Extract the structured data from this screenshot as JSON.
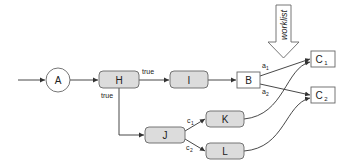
{
  "diagram": {
    "nodes": {
      "A": {
        "label": "A",
        "shape": "circle"
      },
      "H": {
        "label": "H",
        "shape": "rounded-box"
      },
      "I": {
        "label": "I",
        "shape": "rounded-box"
      },
      "B": {
        "label": "B",
        "shape": "box"
      },
      "C1": {
        "label": "C",
        "sub": "1",
        "shape": "box"
      },
      "C2": {
        "label": "C",
        "sub": "2",
        "shape": "box"
      },
      "J": {
        "label": "J",
        "shape": "rounded-box"
      },
      "K": {
        "label": "K",
        "shape": "rounded-box"
      },
      "L": {
        "label": "L",
        "shape": "rounded-box"
      }
    },
    "edges": [
      {
        "from": "start",
        "to": "A",
        "label": ""
      },
      {
        "from": "A",
        "to": "H",
        "label": ""
      },
      {
        "from": "H",
        "to": "I",
        "label": "true"
      },
      {
        "from": "H",
        "to": "J",
        "label": "true"
      },
      {
        "from": "I",
        "to": "B",
        "label": ""
      },
      {
        "from": "B",
        "to": "C1",
        "label": "a",
        "sub": "1"
      },
      {
        "from": "B",
        "to": "C2",
        "label": "a",
        "sub": "2"
      },
      {
        "from": "J",
        "to": "K",
        "label": "c",
        "sub": "1"
      },
      {
        "from": "J",
        "to": "L",
        "label": "c",
        "sub": "2"
      },
      {
        "from": "K",
        "to": "C1",
        "label": ""
      },
      {
        "from": "L",
        "to": "C2",
        "label": ""
      }
    ],
    "edge_labels": {
      "h_i": "true",
      "h_j": "true",
      "a1": "a",
      "a1_sub": "1",
      "a2": "a",
      "a2_sub": "2",
      "c1": "c",
      "c1_sub": "1",
      "c2": "c",
      "c2_sub": "2"
    },
    "worklist_label": "worklist",
    "colors": {
      "node_fill": "#dcdcdc",
      "box_fill": "#ffffff",
      "stroke": "#555555",
      "edge": "#333333"
    }
  }
}
